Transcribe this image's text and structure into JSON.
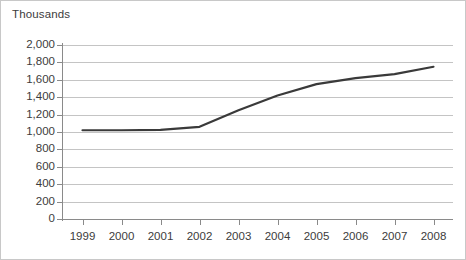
{
  "chart_data": {
    "type": "line",
    "title": "",
    "unit_label": "Thousands",
    "xlabel": "",
    "ylabel": "",
    "categories": [
      "1999",
      "2000",
      "2001",
      "2002",
      "2003",
      "2004",
      "2005",
      "2006",
      "2007",
      "2008"
    ],
    "x": [
      1999,
      2000,
      2001,
      2002,
      2003,
      2004,
      2005,
      2006,
      2007,
      2008
    ],
    "series": [
      {
        "name": "Thousands",
        "values": [
          1020,
          1020,
          1025,
          1060,
          1250,
          1420,
          1550,
          1620,
          1665,
          1750
        ],
        "color": "#3a3a3a"
      }
    ],
    "ylim": [
      0,
      2000
    ],
    "y_ticks": [
      0,
      200,
      400,
      600,
      800,
      1000,
      1200,
      1400,
      1600,
      1800,
      2000
    ],
    "y_tick_labels": [
      "0",
      "200",
      "400",
      "600",
      "800",
      "1,000",
      "1,200",
      "1,400",
      "1,600",
      "1,800",
      "2,000"
    ],
    "x_tick_labels": [
      "1999",
      "2000",
      "2001",
      "2002",
      "2003",
      "2004",
      "2005",
      "2006",
      "2007",
      "2008"
    ],
    "grid": "horizontal",
    "legend": "none",
    "annotations": [],
    "colors": {
      "line": "#3a3a3a",
      "gridline": "#c4c4c4",
      "axis": "#8a8a8a",
      "border": "#c8c8c8",
      "text": "#3c3c3c",
      "background": "#ffffff"
    }
  }
}
